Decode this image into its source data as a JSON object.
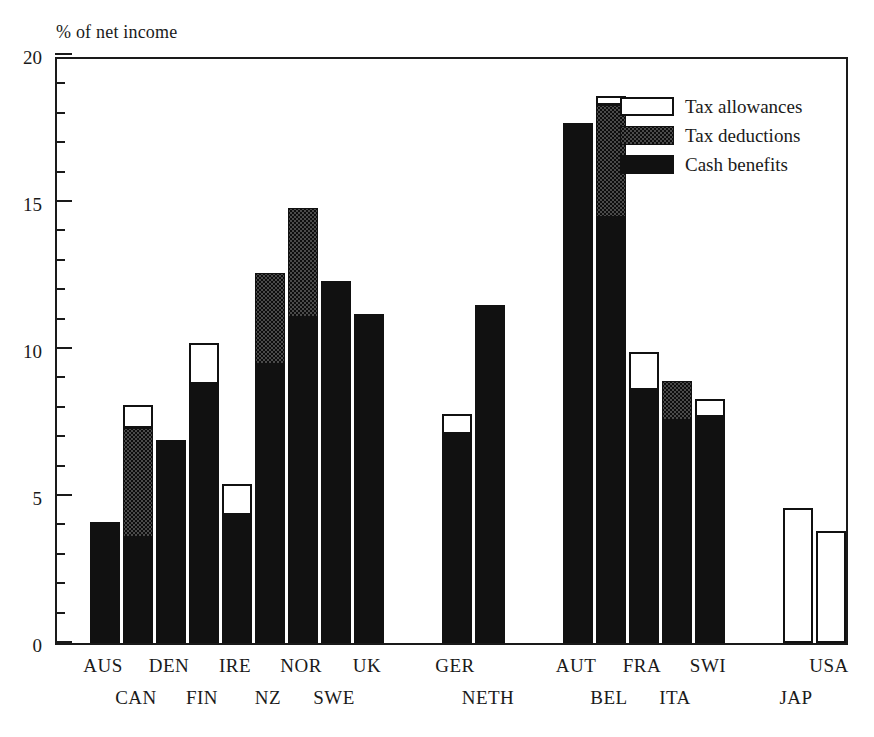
{
  "axis": {
    "ylabel": "% of net income",
    "ytick_labels": [
      "20",
      "15",
      "10",
      "5",
      "0"
    ],
    "ymin": 0,
    "ymax": 20,
    "major_step": 5,
    "minor_step": 1
  },
  "legend": [
    {
      "key": "allowances",
      "label": "Tax allowances",
      "swatch": "white"
    },
    {
      "key": "deductions",
      "label": "Tax deductions",
      "swatch": "stipple"
    },
    {
      "key": "cash",
      "label": "Cash benefits",
      "swatch": "black"
    }
  ],
  "chart_data": {
    "type": "bar",
    "title": "",
    "subtitle": "",
    "xlabel": "",
    "ylabel": "% of net income",
    "ylim": [
      0,
      20
    ],
    "grid": false,
    "stacked": true,
    "legend_position": "top-right",
    "categories": [
      "AUS",
      "CAN",
      "DEN",
      "FIN",
      "IRE",
      "NZ",
      "NOR",
      "SWE",
      "UK",
      "GER",
      "NETH",
      "AUT",
      "BEL",
      "FRA",
      "ITA",
      "SWI",
      "JAP",
      "USA"
    ],
    "series": [
      {
        "name": "Cash benefits",
        "values": [
          4.1,
          3.6,
          6.9,
          8.8,
          4.35,
          9.5,
          11.1,
          12.3,
          11.2,
          7.1,
          11.5,
          17.7,
          14.5,
          8.6,
          7.6,
          7.7,
          0.0,
          0.0
        ]
      },
      {
        "name": "Tax deductions",
        "values": [
          0.0,
          3.7,
          0.0,
          0.0,
          0.0,
          3.1,
          3.7,
          0.0,
          0.0,
          0.0,
          0.0,
          0.0,
          3.8,
          0.0,
          1.3,
          0.0,
          0.0,
          0.0
        ]
      },
      {
        "name": "Tax allowances",
        "values": [
          0.0,
          0.8,
          0.0,
          1.4,
          1.05,
          0.0,
          0.0,
          0.0,
          0.0,
          0.7,
          0.0,
          0.0,
          0.3,
          1.3,
          0.0,
          0.6,
          4.6,
          3.8
        ]
      }
    ],
    "totals": [
      4.1,
      8.1,
      6.9,
      10.2,
      5.4,
      12.6,
      14.8,
      12.3,
      11.2,
      7.8,
      11.5,
      17.7,
      18.6,
      9.9,
      8.9,
      8.3,
      4.6,
      3.8
    ],
    "groups": [
      {
        "gap_after": false
      },
      {
        "gap_after": false
      },
      {
        "gap_after": false
      },
      {
        "gap_after": false
      },
      {
        "gap_after": false
      },
      {
        "gap_after": false
      },
      {
        "gap_after": false
      },
      {
        "gap_after": false
      },
      {
        "gap_after": true
      },
      {
        "gap_after": false
      },
      {
        "gap_after": true
      },
      {
        "gap_after": false
      },
      {
        "gap_after": false
      },
      {
        "gap_after": false
      },
      {
        "gap_after": false
      },
      {
        "gap_after": true
      },
      {
        "gap_after": false
      },
      {
        "gap_after": false
      }
    ]
  },
  "xlabel_rows": {
    "top": [
      "AUS",
      "DEN",
      "IRE",
      "NOR",
      "UK",
      "GER",
      "AUT",
      "FRA",
      "SWI",
      "USA"
    ],
    "bottom": [
      "CAN",
      "FIN",
      "NZ",
      "SWE",
      "NETH",
      "BEL",
      "ITA",
      "JAP"
    ]
  },
  "colors": {
    "ink": "#111111",
    "deduction_fill": "#4a4a4a",
    "allowance_fill": "#ffffff",
    "background": "#ffffff"
  }
}
